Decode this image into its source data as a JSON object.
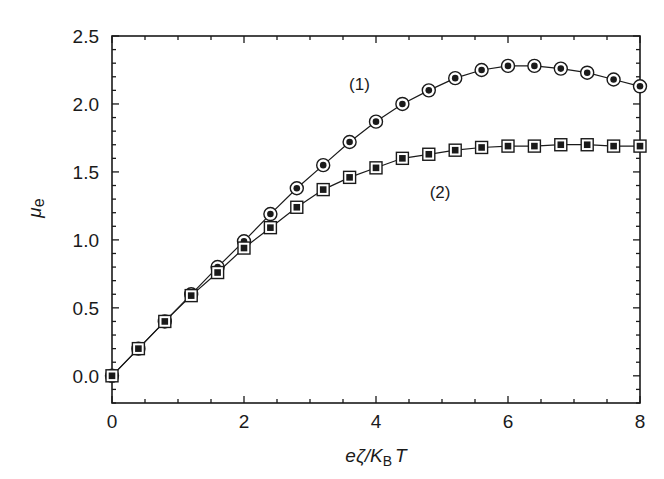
{
  "chart_data": {
    "type": "line",
    "title": "",
    "xlabel": "eζ/K_B T",
    "ylabel": "μ_e",
    "xlabel_parts": {
      "pre": "eζ/K",
      "sub": "B",
      "post": "T"
    },
    "ylabel_parts": {
      "main": "μ",
      "sub": "e"
    },
    "xlim": [
      0,
      8
    ],
    "ylim": [
      -0.2,
      2.5
    ],
    "xticks": [
      0,
      2,
      4,
      6,
      8
    ],
    "xtick_labels": [
      "0",
      "2",
      "4",
      "6",
      "8"
    ],
    "yticks": [
      0.0,
      0.5,
      1.0,
      1.5,
      2.0,
      2.5
    ],
    "ytick_labels": [
      "0.0",
      "0.5",
      "1.0",
      "1.5",
      "2.0",
      "2.5"
    ],
    "grid": false,
    "legend": "none (inline labels)",
    "x": [
      0.0,
      0.4,
      0.8,
      1.2,
      1.6,
      2.0,
      2.4,
      2.8,
      3.2,
      3.6,
      4.0,
      4.4,
      4.8,
      5.2,
      5.6,
      6.0,
      6.4,
      6.8,
      7.2,
      7.6,
      8.0
    ],
    "series": [
      {
        "name": "(1)",
        "marker": "circle-dot",
        "values": [
          0.0,
          0.2,
          0.4,
          0.6,
          0.8,
          0.99,
          1.19,
          1.38,
          1.55,
          1.72,
          1.87,
          2.0,
          2.1,
          2.19,
          2.25,
          2.28,
          2.28,
          2.26,
          2.23,
          2.18,
          2.13
        ]
      },
      {
        "name": "(2)",
        "marker": "square-dot",
        "values": [
          0.0,
          0.2,
          0.4,
          0.59,
          0.76,
          0.94,
          1.09,
          1.24,
          1.37,
          1.46,
          1.53,
          1.6,
          1.63,
          1.66,
          1.68,
          1.69,
          1.69,
          1.7,
          1.7,
          1.69,
          1.69
        ]
      }
    ],
    "annotations": [
      {
        "text": "(1)",
        "x": 3.75,
        "y": 2.15
      },
      {
        "text": "(2)",
        "x": 4.97,
        "y": 1.35
      }
    ]
  },
  "colors": {
    "line": "#1a1a1a",
    "background": "#ffffff"
  }
}
